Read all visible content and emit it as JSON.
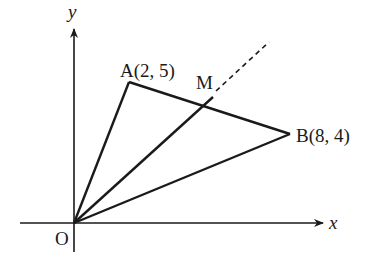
{
  "diagram": {
    "type": "coordinate-geometry",
    "axes": {
      "x_label": "x",
      "y_label": "y",
      "origin_label": "O"
    },
    "points": [
      {
        "name": "A",
        "label": "A(2, 5)",
        "x": 2,
        "y": 5
      },
      {
        "name": "B",
        "label": "B(8, 4)",
        "x": 8,
        "y": 4
      },
      {
        "name": "M",
        "label": "M",
        "note": "point on segment AB"
      }
    ],
    "segments": [
      {
        "from": "O",
        "to": "A",
        "style": "solid"
      },
      {
        "from": "O",
        "to": "B",
        "style": "solid"
      },
      {
        "from": "A",
        "to": "B",
        "style": "solid"
      },
      {
        "from": "O",
        "to": "M",
        "style": "solid"
      },
      {
        "from": "M",
        "to": "beyond",
        "style": "dashed",
        "note": "extension of OM past M"
      }
    ],
    "colors": {
      "stroke": "#1a1a1a",
      "background": "#ffffff"
    }
  }
}
